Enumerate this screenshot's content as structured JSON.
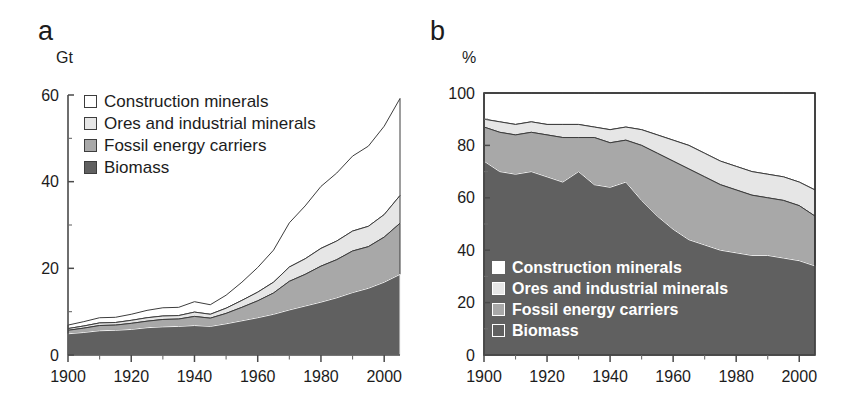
{
  "figure": {
    "panels": [
      {
        "letter": "a",
        "unit": "Gt",
        "y_ticks": [
          "0",
          "20",
          "40",
          "60"
        ],
        "x_ticks": [
          "1900",
          "1920",
          "1940",
          "1960",
          "1980",
          "2000"
        ]
      },
      {
        "letter": "b",
        "unit": "%",
        "y_ticks": [
          "0",
          "20",
          "40",
          "60",
          "80",
          "100"
        ],
        "x_ticks": [
          "1900",
          "1920",
          "1940",
          "1960",
          "1980",
          "2000"
        ]
      }
    ]
  },
  "legend": {
    "items": [
      {
        "label": "Construction minerals",
        "color": "#ffffff"
      },
      {
        "label": "Ores and industrial minerals",
        "color": "#e6e6e6"
      },
      {
        "label": "Fossil energy carriers",
        "color": "#a8a8a8"
      },
      {
        "label": "Biomass",
        "color": "#606060"
      }
    ]
  },
  "chart_data": [
    {
      "type": "area",
      "panel": "a",
      "title": "Global material extraction by material group, absolute",
      "stacked": true,
      "xlabel": "",
      "ylabel": "Gt",
      "xlim": [
        1900,
        2005
      ],
      "ylim": [
        0,
        60
      ],
      "grid": false,
      "legend_position": "upper-left-inside",
      "x": [
        1900,
        1905,
        1910,
        1915,
        1920,
        1925,
        1930,
        1935,
        1940,
        1945,
        1950,
        1955,
        1960,
        1965,
        1970,
        1975,
        1980,
        1985,
        1990,
        1995,
        2000,
        2005
      ],
      "series": [
        {
          "name": "Biomass",
          "color": "#606060",
          "values": [
            4.9,
            5.2,
            5.6,
            5.7,
            5.9,
            6.3,
            6.5,
            6.6,
            6.8,
            6.6,
            7.2,
            7.9,
            8.6,
            9.4,
            10.4,
            11.3,
            12.2,
            13.2,
            14.4,
            15.4,
            16.8,
            18.6
          ]
        },
        {
          "name": "Fossil energy carriers",
          "color": "#a8a8a8",
          "values": [
            0.8,
            1.0,
            1.2,
            1.2,
            1.4,
            1.5,
            1.7,
            1.7,
            2.1,
            1.9,
            2.4,
            3.1,
            3.9,
            4.9,
            6.6,
            7.3,
            8.3,
            8.8,
            9.6,
            9.6,
            10.4,
            11.8
          ]
        },
        {
          "name": "Ores and industrial minerals",
          "color": "#e6e6e6",
          "values": [
            0.4,
            0.5,
            0.6,
            0.6,
            0.7,
            0.8,
            0.8,
            0.8,
            1.0,
            0.9,
            1.2,
            1.6,
            2.0,
            2.5,
            3.3,
            3.6,
            4.1,
            4.3,
            4.6,
            4.7,
            5.2,
            6.4
          ]
        },
        {
          "name": "Construction minerals",
          "color": "#ffffff",
          "values": [
            0.8,
            1.0,
            1.2,
            1.2,
            1.4,
            1.7,
            1.9,
            1.9,
            2.4,
            2.2,
            3.0,
            4.2,
            5.7,
            7.4,
            10.2,
            12.2,
            14.3,
            15.7,
            17.3,
            18.5,
            20.4,
            22.4
          ]
        }
      ],
      "totals": [
        6.9,
        7.7,
        8.6,
        8.7,
        9.4,
        10.3,
        10.9,
        11.0,
        12.3,
        11.6,
        13.8,
        16.8,
        20.2,
        24.2,
        30.5,
        34.4,
        38.9,
        42.0,
        45.9,
        48.2,
        52.8,
        59.2
      ]
    },
    {
      "type": "area",
      "panel": "b",
      "title": "Global material extraction by material group, share",
      "stacked": true,
      "xlabel": "",
      "ylabel": "%",
      "xlim": [
        1900,
        2005
      ],
      "ylim": [
        0,
        100
      ],
      "grid": false,
      "legend_position": "lower-left-inside",
      "x": [
        1900,
        1905,
        1910,
        1915,
        1920,
        1925,
        1930,
        1935,
        1940,
        1945,
        1950,
        1955,
        1960,
        1965,
        1970,
        1975,
        1980,
        1985,
        1990,
        1995,
        2000,
        2005
      ],
      "series": [
        {
          "name": "Biomass",
          "color": "#606060",
          "values": [
            74,
            70,
            69,
            70,
            68,
            66,
            70,
            65,
            64,
            66,
            59,
            53,
            48,
            44,
            42,
            40,
            39,
            38,
            38,
            37,
            36,
            34
          ]
        },
        {
          "name": "Fossil energy carriers",
          "color": "#a8a8a8",
          "values": [
            13,
            15,
            15,
            15,
            16,
            17,
            13,
            18,
            17,
            16,
            21,
            24,
            26,
            27,
            26,
            25,
            24,
            23,
            22,
            22,
            21,
            19
          ]
        },
        {
          "name": "Ores and industrial minerals",
          "color": "#e6e6e6",
          "values": [
            3,
            4,
            4,
            4,
            4,
            5,
            5,
            4,
            5,
            5,
            6,
            7,
            8,
            9,
            9,
            9,
            9,
            9,
            9,
            9,
            9,
            10
          ]
        },
        {
          "name": "Construction minerals",
          "color": "#ffffff",
          "values": [
            10,
            11,
            12,
            11,
            12,
            12,
            12,
            13,
            14,
            13,
            14,
            16,
            18,
            20,
            23,
            26,
            28,
            30,
            31,
            32,
            34,
            37
          ]
        }
      ]
    }
  ]
}
